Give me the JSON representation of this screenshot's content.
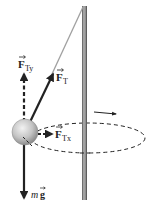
{
  "diagram": {
    "type": "conical-pendulum-free-body",
    "labels": {
      "tension_y": {
        "main": "F",
        "sub": "Ty"
      },
      "tension": {
        "main": "F",
        "sub": "T"
      },
      "tension_x": {
        "main": "F",
        "sub": "Tx"
      },
      "weight": {
        "m": "m",
        "g": "g"
      }
    },
    "colors": {
      "pole": "#8a8a8a",
      "pole_edge": "#444444",
      "string": "#9a9a9a",
      "arrow": "#222222",
      "ball": "#c8c8c8",
      "path": "#222222"
    }
  }
}
